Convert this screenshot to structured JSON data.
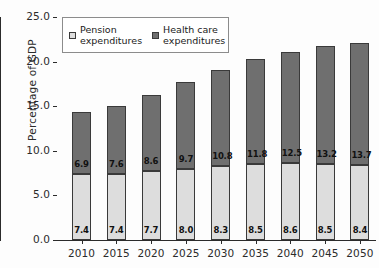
{
  "chart_data": {
    "type": "bar",
    "subtype": "stacked-vertical",
    "title": "",
    "xlabel": "",
    "ylabel": "Percentage of GDP",
    "ylim": [
      0.0,
      25.0
    ],
    "ytick_step": 5.0,
    "ytick_labels": [
      "0.0",
      "5.0",
      "10.0",
      "15.0",
      "20.0",
      "25.0"
    ],
    "ytick_values": [
      0.0,
      5.0,
      10.0,
      15.0,
      20.0,
      25.0
    ],
    "grid": false,
    "legend_position": "upper-left-inside",
    "categories": [
      "2010",
      "2015",
      "2020",
      "2025",
      "2030",
      "2035",
      "2040",
      "2045",
      "2050"
    ],
    "series": [
      {
        "name": "Pension expenditures",
        "color": "#dddddd",
        "values": [
          7.4,
          7.4,
          7.7,
          8.0,
          8.3,
          8.5,
          8.6,
          8.5,
          8.4
        ],
        "labels": [
          "7.4",
          "7.4",
          "7.7",
          "8.0",
          "8.3",
          "8.5",
          "8.6",
          "8.5",
          "8.4"
        ]
      },
      {
        "name": "Health care expenditures",
        "color": "#6f6f6f",
        "values": [
          6.9,
          7.6,
          8.6,
          9.7,
          10.8,
          11.8,
          12.5,
          13.2,
          13.7
        ],
        "labels": [
          "6.9",
          "7.6",
          "8.6",
          "9.7",
          "10.8",
          "11.8",
          "12.5",
          "13.2",
          "13.7"
        ]
      }
    ],
    "totals": [
      14.3,
      15.0,
      16.3,
      17.7,
      19.1,
      20.3,
      21.1,
      21.7,
      22.1
    ]
  },
  "legend": {
    "entries": [
      {
        "label": "Pension\nexpenditures",
        "swatch_color": "#dddddd"
      },
      {
        "label": "Health care\nexpenditures",
        "swatch_color": "#6f6f6f"
      }
    ]
  },
  "axes": {
    "y_title": "Percentage of GDP"
  }
}
